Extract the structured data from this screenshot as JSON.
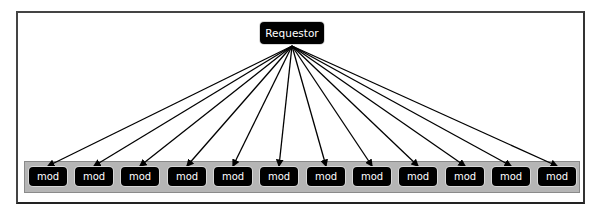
{
  "diagram": {
    "type": "fan-out",
    "requestor": {
      "label": "Requestor"
    },
    "modules": [
      {
        "label": "mod"
      },
      {
        "label": "mod"
      },
      {
        "label": "mod"
      },
      {
        "label": "mod"
      },
      {
        "label": "mod"
      },
      {
        "label": "mod"
      },
      {
        "label": "mod"
      },
      {
        "label": "mod"
      },
      {
        "label": "mod"
      },
      {
        "label": "mod"
      },
      {
        "label": "mod"
      },
      {
        "label": "mod"
      }
    ],
    "colors": {
      "node_fill": "#000000",
      "node_text": "#ffffff",
      "band_fill": "#b5b5b5",
      "edge": "#000000"
    }
  }
}
